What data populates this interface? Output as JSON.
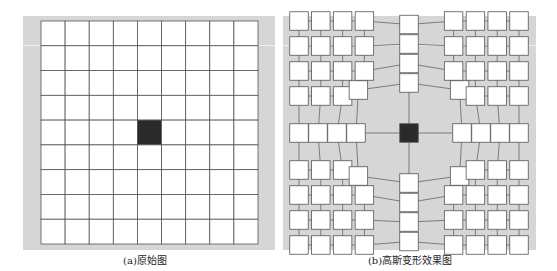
{
  "figure": {
    "panels": [
      {
        "id": "a",
        "caption": "(a)原始图",
        "description": "Regular 9x9 grid of white squares with a single dark center cell",
        "grid": {
          "rows": 9,
          "cols": 9,
          "center_cell": [
            4,
            4
          ]
        }
      },
      {
        "id": "b",
        "caption": "(b)高斯变形效果图",
        "description": "Gaussian-deformed grid: squares pushed outward from the dark center cell, connected by thin lines",
        "grid": {
          "rows": 9,
          "cols": 9,
          "center_cell": [
            4,
            4
          ]
        }
      }
    ],
    "colors": {
      "background": "#d6d6d6",
      "cell_fill": "#ffffff",
      "cell_stroke": "#555555",
      "center_fill": "#2a2a2a",
      "caption_text": "#222222"
    }
  }
}
